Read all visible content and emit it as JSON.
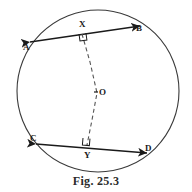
{
  "figure": {
    "caption": "Fig. 25.3",
    "kind": "geometry-diagram",
    "ink_color": "#3a3a3a",
    "chord_color": "#1a1a1a",
    "dash_color": "#555555",
    "background": "#ffffff"
  },
  "circle": {
    "label": "circle",
    "cx": 98,
    "cy": 91,
    "r": 81,
    "stroke_width": 1.1
  },
  "points": {
    "A": {
      "label": "A",
      "x": 30,
      "y": 42,
      "label_x": 23,
      "label_y": 43
    },
    "B": {
      "label": "B",
      "x": 140,
      "y": 26,
      "label_x": 136,
      "label_y": 24
    },
    "C": {
      "label": "C",
      "x": 36,
      "y": 144,
      "label_x": 30,
      "label_y": 134
    },
    "D": {
      "label": "D",
      "x": 147,
      "y": 153,
      "label_x": 145,
      "label_y": 144
    },
    "X": {
      "label": "X",
      "x": 82,
      "y": 33,
      "label_x": 79,
      "label_y": 20
    },
    "Y": {
      "label": "Y",
      "x": 87,
      "y": 146,
      "label_x": 84,
      "label_y": 151
    },
    "O": {
      "label": "O",
      "x": 97,
      "y": 93,
      "label_x": 99,
      "label_y": 88
    }
  },
  "chords": [
    {
      "name": "chord-ab",
      "from": "A",
      "to": "B",
      "x1": 30,
      "y1": 42,
      "x2": 140,
      "y2": 26
    },
    {
      "name": "chord-cd",
      "from": "C",
      "to": "D",
      "x1": 36,
      "y1": 144,
      "x2": 147,
      "y2": 153
    }
  ],
  "dashed_path": {
    "name": "perpendicular-bisector-xy",
    "points": "82,34 90,62 97,93 92,120 87,145",
    "dasharray": "4 3",
    "stroke_width": 1.1
  },
  "right_angles": [
    {
      "name": "right-angle-x",
      "x": 79,
      "y": 34,
      "size": 7,
      "rotate": -8
    },
    {
      "name": "right-angle-y",
      "x": 83,
      "y": 138,
      "size": 7,
      "rotate": 5
    }
  ],
  "centre_tick": {
    "name": "centre-tick-o",
    "x1": 94,
    "y1": 92,
    "x2": 98,
    "y2": 92
  }
}
